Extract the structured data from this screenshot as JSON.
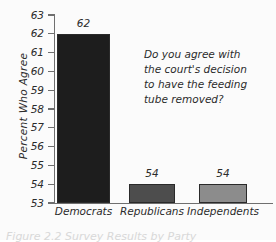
{
  "chart_data": {
    "type": "bar",
    "title": "",
    "subtitle": "",
    "xlabel": "",
    "ylabel": "Percent Who Agree",
    "categories": [
      "Democrats",
      "Republicans",
      "Independents"
    ],
    "values": [
      62,
      54,
      54
    ],
    "value_labels": [
      "62",
      "54",
      "54"
    ],
    "ylim": [
      53,
      63
    ],
    "y_ticks": [
      63,
      62,
      61,
      60,
      59,
      58,
      57,
      56,
      55,
      54,
      53
    ],
    "y_tick_labels": [
      "63",
      "62",
      "61",
      "60",
      "59",
      "58",
      "57",
      "56",
      "55",
      "54",
      "53"
    ],
    "grid": false,
    "legend": "none",
    "bar_colors": [
      "#1d1d1d",
      "#4d4d4d",
      "#8c8c8c"
    ],
    "annotations": [
      "Do you agree with",
      "the court's decision",
      "to have the feeding",
      "tube removed?"
    ]
  },
  "figure": {
    "background_color": "#fbfbfb",
    "axis_color": "#6f6f6f",
    "text_color": "#2b2b2b",
    "caption": "Figure  2.2   Survey Results by Party"
  }
}
